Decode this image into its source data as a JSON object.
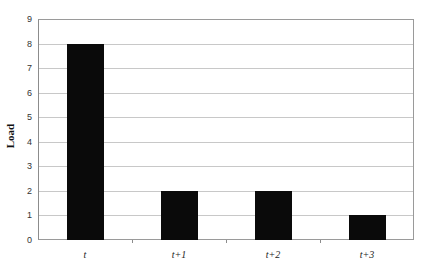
{
  "chart_data": {
    "type": "bar",
    "title": "",
    "xlabel": "",
    "ylabel": "Load",
    "categories": [
      "t",
      "t+1",
      "t+2",
      "t+3"
    ],
    "values": [
      8,
      2,
      2,
      1
    ],
    "ylim": [
      0,
      9
    ],
    "yticks": [
      "0",
      "1",
      "2",
      "3",
      "4",
      "5",
      "6",
      "7",
      "8",
      "9"
    ],
    "grid": true,
    "legend": null,
    "bar_color": "#0a0a0a"
  }
}
